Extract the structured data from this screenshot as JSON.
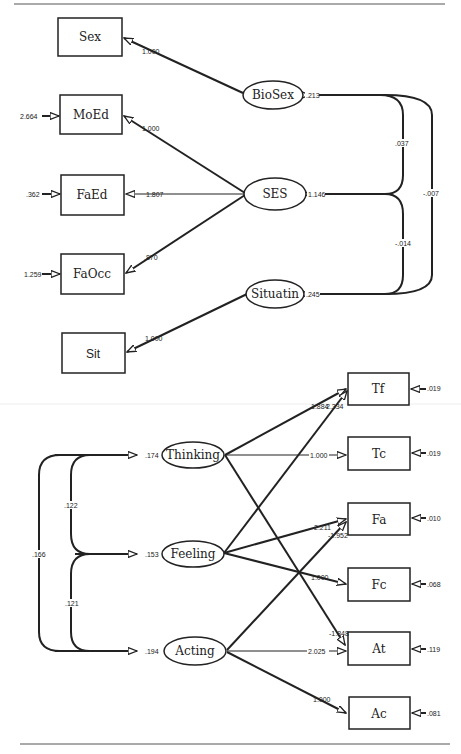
{
  "diagram": {
    "type": "structural-equation-model",
    "top_model": {
      "observed": [
        {
          "id": "sex",
          "label": "Sex"
        },
        {
          "id": "moed",
          "label": "MoEd",
          "error": "2.664"
        },
        {
          "id": "faed",
          "label": "FaEd",
          "error": ".362"
        },
        {
          "id": "faocc",
          "label": "FaOcc",
          "error": "1.259"
        },
        {
          "id": "sit",
          "label": "Sit"
        }
      ],
      "latent": [
        {
          "id": "biosex",
          "label": "BioSex",
          "variance": ".213"
        },
        {
          "id": "ses",
          "label": "SES",
          "variance": "1.146"
        },
        {
          "id": "situatin",
          "label": "Situatin",
          "variance": ".245"
        }
      ],
      "loadings": [
        {
          "from": "biosex",
          "to": "sex",
          "value": "1.000"
        },
        {
          "from": "ses",
          "to": "moed",
          "value": "1.000"
        },
        {
          "from": "ses",
          "to": "faed",
          "value": "1.807"
        },
        {
          "from": "ses",
          "to": "faocc",
          "value": ".870"
        },
        {
          "from": "situatin",
          "to": "sit",
          "value": "1.000"
        }
      ],
      "covariances": [
        {
          "between": [
            "biosex",
            "ses"
          ],
          "value": ".037"
        },
        {
          "between": [
            "ses",
            "situatin"
          ],
          "value": "-.014"
        },
        {
          "between": [
            "biosex",
            "situatin"
          ],
          "value": "-.007"
        }
      ]
    },
    "bottom_model": {
      "observed": [
        {
          "id": "tf",
          "label": "Tf",
          "error": ".019"
        },
        {
          "id": "tc",
          "label": "Tc",
          "error": ".019"
        },
        {
          "id": "fa",
          "label": "Fa",
          "error": ".010"
        },
        {
          "id": "fc",
          "label": "Fc",
          "error": ".068"
        },
        {
          "id": "at",
          "label": "At",
          "error": ".119"
        },
        {
          "id": "ac",
          "label": "Ac",
          "error": ".081"
        }
      ],
      "latent": [
        {
          "id": "thinking",
          "label": "Thinking",
          "variance": ".174"
        },
        {
          "id": "feeling",
          "label": "Feeling",
          "variance": ".153"
        },
        {
          "id": "acting",
          "label": "Acting",
          "variance": ".194"
        }
      ],
      "loadings": [
        {
          "from": "thinking",
          "to": "tf",
          "value": "1.884"
        },
        {
          "from": "feeling",
          "to": "tf",
          "value": "2.334"
        },
        {
          "from": "thinking",
          "to": "tc",
          "value": "1.000"
        },
        {
          "from": "feeling",
          "to": "fa",
          "value": "2.211"
        },
        {
          "from": "acting",
          "to": "fa",
          "value": "-1.952"
        },
        {
          "from": "feeling",
          "to": "fc",
          "value": "1.000"
        },
        {
          "from": "thinking",
          "to": "at",
          "value": "-1.848"
        },
        {
          "from": "acting",
          "to": "at",
          "value": "2.025"
        },
        {
          "from": "acting",
          "to": "ac",
          "value": "1.000"
        }
      ],
      "covariances": [
        {
          "between": [
            "thinking",
            "feeling"
          ],
          "value": ".122"
        },
        {
          "between": [
            "feeling",
            "acting"
          ],
          "value": ".121"
        },
        {
          "between": [
            "thinking",
            "acting"
          ],
          "value": ".166"
        }
      ]
    }
  }
}
